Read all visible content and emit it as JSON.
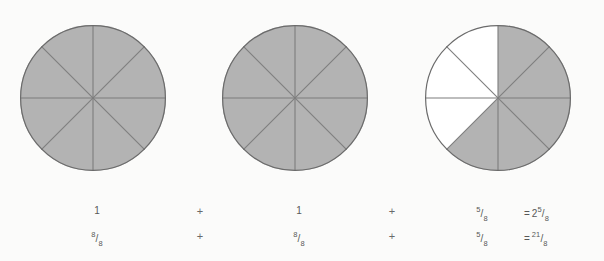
{
  "figure": {
    "background_color": "#fbfbfa",
    "shaded_color": "#b3b3b3",
    "unshaded_color": "#ffffff",
    "outline_color": "#6b6b6b",
    "divider_color": "#7d7d7d"
  },
  "circles": [
    {
      "name": "circle-one",
      "sectors_total": 8,
      "sectors_shaded": 8,
      "shaded_indices": [
        0,
        1,
        2,
        3,
        4,
        5,
        6,
        7
      ],
      "value_label": "1",
      "fraction_label": "8/8"
    },
    {
      "name": "circle-two",
      "sectors_total": 8,
      "sectors_shaded": 8,
      "shaded_indices": [
        0,
        1,
        2,
        3,
        4,
        5,
        6,
        7
      ],
      "value_label": "1",
      "fraction_label": "8/8"
    },
    {
      "name": "circle-three",
      "sectors_total": 8,
      "sectors_shaded": 5,
      "shaded_indices": [
        0,
        1,
        2,
        3,
        4
      ],
      "value_label": "5/8",
      "fraction_label": "5/8"
    }
  ],
  "equation_top": {
    "term_1": "1",
    "operator_1": "+",
    "term_2": "1",
    "operator_2": "+",
    "term_3_num": "5",
    "term_3_bar": "/",
    "term_3_den": "8",
    "equals": "=",
    "result_whole": "2",
    "result_num": "5",
    "result_bar": "/",
    "result_den": "8"
  },
  "equation_bottom": {
    "term_1_num": "8",
    "term_1_bar": "/",
    "term_1_den": "8",
    "operator_1": "+",
    "term_2_num": "8",
    "term_2_bar": "/",
    "term_2_den": "8",
    "operator_2": "+",
    "term_3_num": "5",
    "term_3_bar": "/",
    "term_3_den": "8",
    "equals": "=",
    "result_num": "21",
    "result_bar": "/",
    "result_den": "8"
  }
}
